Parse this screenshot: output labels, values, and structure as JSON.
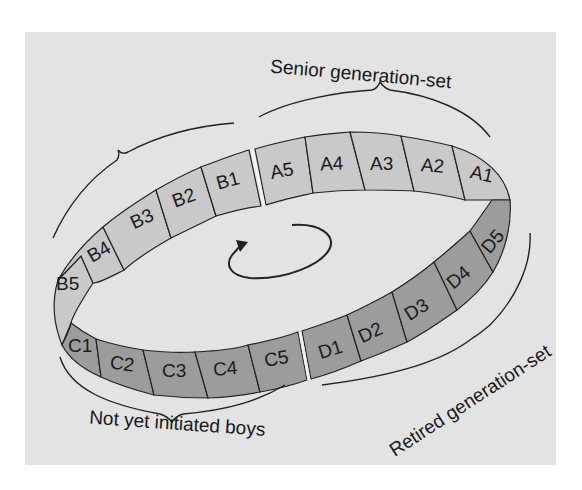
{
  "diagram": {
    "colors": {
      "panel": "#e3e3e3",
      "upper_band": "#c9c9c9",
      "lower_band": "#9c9c9c",
      "lines": "#222222"
    },
    "segments": {
      "A": [
        "A1",
        "A2",
        "A3",
        "A4",
        "A5"
      ],
      "B": [
        "B1",
        "B2",
        "B3",
        "B4",
        "B5"
      ],
      "C": [
        "C1",
        "C2",
        "C3",
        "C4",
        "C5"
      ],
      "D": [
        "D1",
        "D2",
        "D3",
        "D4",
        "D5"
      ]
    },
    "labels": {
      "senior": "Senior generation-set",
      "retired": "Retired generation-set",
      "not_initiated": "Not yet initiated boys"
    },
    "center_icon": "rotation-arrow-icon"
  }
}
